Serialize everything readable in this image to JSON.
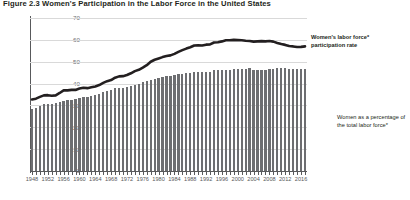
{
  "figure": {
    "title": "Figure 2.3  Women's Participation in the Labor Force in the United States"
  },
  "annotations": {
    "line_label": "Women's labor force* participation rate",
    "bar_label": "Women as a percentage of the total labor force*"
  },
  "axis": {
    "y_title": "PERCENTAGE",
    "y_ticks": [
      "0",
      "10",
      "20",
      "30",
      "40",
      "50",
      "60",
      "70"
    ]
  },
  "chart_data": {
    "type": "bar",
    "title": "Figure 2.3  Women's Participation in the Labor Force in the United States",
    "xlabel": "",
    "ylabel": "PERCENTAGE",
    "ylim": [
      0,
      70
    ],
    "grid": true,
    "legend_position": "right-annotations",
    "x_tick_labels": [
      "1948",
      "1952",
      "1956",
      "1960",
      "1964",
      "1968",
      "1972",
      "1976",
      "1980",
      "1984",
      "1988",
      "1992",
      "1996",
      "2000",
      "2004",
      "2008",
      "2012",
      "2016"
    ],
    "x": [
      1948,
      1949,
      1950,
      1951,
      1952,
      1953,
      1954,
      1955,
      1956,
      1957,
      1958,
      1959,
      1960,
      1961,
      1962,
      1963,
      1964,
      1965,
      1966,
      1967,
      1968,
      1969,
      1970,
      1971,
      1972,
      1973,
      1974,
      1975,
      1976,
      1977,
      1978,
      1979,
      1980,
      1981,
      1982,
      1983,
      1984,
      1985,
      1986,
      1987,
      1988,
      1989,
      1990,
      1991,
      1992,
      1993,
      1994,
      1995,
      1996,
      1997,
      1998,
      1999,
      2000,
      2001,
      2002,
      2003,
      2004,
      2005,
      2006,
      2007,
      2008,
      2009,
      2010,
      2011,
      2012,
      2013,
      2014,
      2015,
      2016,
      2017
    ],
    "series": [
      {
        "name": "Women as a percentage of the total labor force*",
        "type": "bar",
        "values": [
          28.6,
          28.8,
          29.6,
          30.5,
          30.8,
          30.8,
          30.9,
          31.6,
          32.2,
          32.5,
          32.7,
          32.9,
          33.4,
          33.8,
          34.0,
          34.4,
          34.8,
          35.2,
          36.0,
          36.7,
          37.1,
          37.8,
          38.1,
          38.2,
          38.5,
          38.9,
          39.4,
          40.0,
          40.5,
          41.0,
          41.7,
          42.1,
          42.5,
          43.0,
          43.3,
          43.5,
          43.8,
          44.2,
          44.5,
          44.8,
          45.0,
          45.2,
          45.2,
          45.4,
          45.5,
          45.5,
          46.0,
          46.1,
          46.2,
          46.2,
          46.3,
          46.5,
          46.6,
          46.6,
          46.6,
          47.0,
          46.4,
          46.4,
          46.3,
          46.4,
          46.5,
          46.8,
          47.2,
          47.0,
          47.0,
          46.9,
          46.8,
          46.8,
          46.8,
          46.9
        ]
      },
      {
        "name": "Women's labor force* participation rate",
        "type": "line",
        "values": [
          32.7,
          33.1,
          33.9,
          34.6,
          34.7,
          34.4,
          34.6,
          35.7,
          36.9,
          36.9,
          37.1,
          37.1,
          37.7,
          38.1,
          37.9,
          38.3,
          38.7,
          39.3,
          40.3,
          41.1,
          41.6,
          42.7,
          43.3,
          43.4,
          43.9,
          44.7,
          45.7,
          46.3,
          47.3,
          48.4,
          50.0,
          50.9,
          51.5,
          52.1,
          52.6,
          52.9,
          53.6,
          54.5,
          55.3,
          56.0,
          56.6,
          57.4,
          57.5,
          57.4,
          57.8,
          57.9,
          58.8,
          58.9,
          59.3,
          59.8,
          59.8,
          60.0,
          59.9,
          59.8,
          59.6,
          59.5,
          59.2,
          59.3,
          59.4,
          59.3,
          59.5,
          59.2,
          58.6,
          58.1,
          57.7,
          57.2,
          57.0,
          56.7,
          56.8,
          57.0
        ]
      }
    ]
  }
}
